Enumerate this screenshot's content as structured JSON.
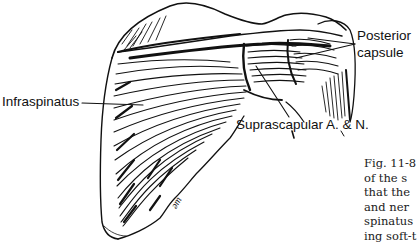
{
  "figure": {
    "type": "anatomical-illustration",
    "labels": {
      "infraspinatus": "Infraspinatus",
      "posterior_capsule_line1": "Posterior",
      "posterior_capsule_line2": "capsule",
      "suprascapular": "Suprascapular A. & N."
    },
    "artist_signature": "ǝm",
    "ink_color": "#111111",
    "background_color": "#ffffff"
  },
  "caption": {
    "lines": [
      "Fig. 11-8",
      "of the s",
      "that the",
      "and ner",
      "spinatus",
      "ing soft-t"
    ]
  }
}
